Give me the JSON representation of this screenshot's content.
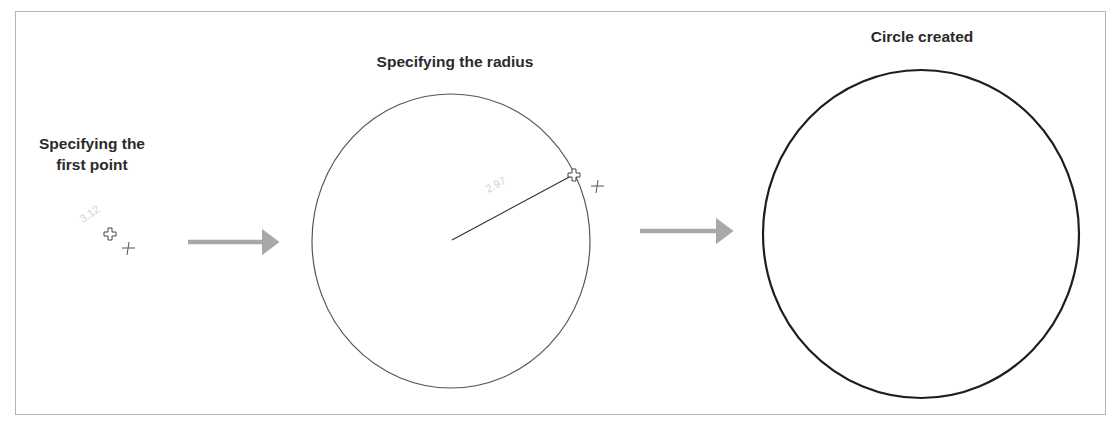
{
  "diagram": {
    "type": "process-flow",
    "stages": [
      {
        "id": "first-point",
        "label": "Specifying the first point",
        "label_line1": "Specifying the",
        "label_line2": "first point",
        "dynamic_input_value": "3.12",
        "cursor": "crosshair-plus"
      },
      {
        "id": "radius",
        "label": "Specifying the radius",
        "dynamic_input_value": "2.97",
        "cursor": "crosshair-plus"
      },
      {
        "id": "circle-created",
        "label": "Circle created"
      }
    ],
    "connectors": [
      {
        "from": "first-point",
        "to": "radius",
        "style": "gray-arrow"
      },
      {
        "from": "radius",
        "to": "circle-created",
        "style": "gray-arrow"
      }
    ],
    "colors": {
      "border": "#b4b4b4",
      "text": "#2b2b2b",
      "arrow": "#a8a8a8",
      "circle_preview": "#555555",
      "circle_final": "#1e1e1e",
      "dim_text": "#d2d2d2"
    }
  }
}
